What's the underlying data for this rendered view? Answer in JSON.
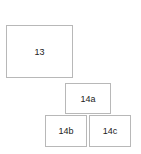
{
  "diagram": {
    "boxes": [
      {
        "id": "13",
        "label": "13"
      },
      {
        "id": "14a",
        "label": "14a"
      },
      {
        "id": "14b",
        "label": "14b"
      },
      {
        "id": "14c",
        "label": "14c"
      }
    ]
  }
}
